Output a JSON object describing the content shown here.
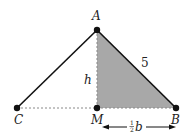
{
  "diagram": {
    "points": {
      "A": {
        "label": "A",
        "x": 97,
        "y": 30
      },
      "B": {
        "label": "B",
        "x": 176,
        "y": 108
      },
      "C": {
        "label": "C",
        "x": 17,
        "y": 108
      },
      "M": {
        "label": "M",
        "x": 97,
        "y": 108
      }
    },
    "labels": {
      "height": "h",
      "side_AB": "5",
      "half_base_num": "1",
      "half_base_den": "2",
      "half_base_var": "b"
    },
    "colors": {
      "shade": "#a8a8a8",
      "line": "#111111",
      "dashed": "#888888"
    }
  }
}
